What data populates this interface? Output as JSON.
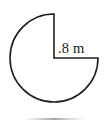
{
  "figure": {
    "kind": "geometry-diagram",
    "background_color": "#ffffff",
    "stroke_color": "#231f20",
    "labels": {
      "radius": ".8 m"
    },
    "geometry": {
      "center_x": 54,
      "center_y": 58,
      "radius_px": 44,
      "missing_wedge_start_deg": 0,
      "missing_wedge_end_deg": 90,
      "missing_wedge_sweep_deg": 90,
      "shape_path": "M 54 58 L 54 14 A 44 44 0 1 0 98 58 L 54 58 Z"
    },
    "label_position": {
      "x": 58,
      "y": 53
    }
  }
}
